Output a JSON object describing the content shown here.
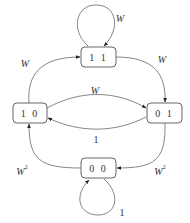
{
  "diagram": {
    "type": "state-transition-diagram",
    "nodes": {
      "n11": {
        "label": "1 1"
      },
      "n10": {
        "label": "1 0"
      },
      "n01": {
        "label": "0 1"
      },
      "n00": {
        "label": "0 0"
      }
    },
    "edges": {
      "e11_11": {
        "from": "11",
        "to": "11",
        "label": "W"
      },
      "e10_11": {
        "from": "10",
        "to": "11",
        "label": "W"
      },
      "e11_01": {
        "from": "11",
        "to": "01",
        "label": "W"
      },
      "e10_01": {
        "from": "10",
        "to": "01",
        "label": "W"
      },
      "e01_10": {
        "from": "01",
        "to": "10",
        "label": "1"
      },
      "e00_10": {
        "from": "00",
        "to": "10",
        "label_base": "W",
        "label_exp": "2"
      },
      "e01_00": {
        "from": "01",
        "to": "00",
        "label_base": "W",
        "label_exp": "2"
      },
      "e00_00": {
        "from": "00",
        "to": "00",
        "label": "1"
      }
    },
    "colors": {
      "edge": "#777777",
      "node_border": "#555555",
      "text": "#333333"
    }
  }
}
